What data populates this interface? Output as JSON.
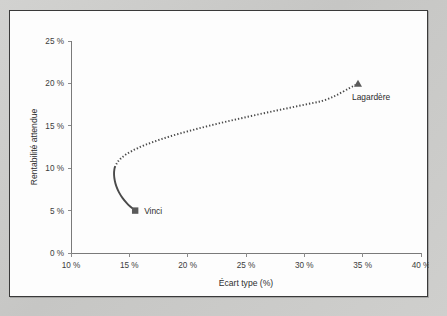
{
  "figure": {
    "background_color": "#c9c9c7",
    "panel_color": "#fdfdfd",
    "border_color": "#3a3a3a"
  },
  "chart_data": {
    "type": "line",
    "title": "",
    "subtitle": "",
    "xlabel": "Écart type (%)",
    "ylabel": "Rentabilité attendue",
    "xlim": [
      10,
      40
    ],
    "ylim": [
      0,
      25
    ],
    "xticks": [
      10,
      15,
      20,
      25,
      30,
      35,
      40
    ],
    "yticks": [
      0,
      5,
      10,
      15,
      20,
      25
    ],
    "xtick_labels": [
      "10 %",
      "15 %",
      "20 %",
      "25 %",
      "30 %",
      "35 %",
      "40 %"
    ],
    "ytick_labels": [
      "0 %",
      "5 %",
      "10 %",
      "15 %",
      "20 %",
      "25 %"
    ],
    "grid": false,
    "legend": "none",
    "line_style": "dotted",
    "line_color": "#4a4a4a",
    "series": [
      {
        "name": "Frontière efficiente Vinci - Lagardère",
        "x": [
          15.5,
          15.0,
          14.6,
          14.25,
          13.98,
          13.8,
          13.7,
          13.68,
          13.75,
          13.92,
          14.18,
          14.52,
          14.95,
          15.45,
          16.02,
          16.65,
          17.33,
          18.06,
          18.84,
          19.66,
          20.52,
          21.41,
          22.33,
          23.28,
          24.26,
          25.26,
          26.28,
          27.32,
          28.38,
          29.46,
          30.55,
          31.66,
          32.78,
          33.92,
          34.6
        ],
        "y": [
          5.0,
          5.55,
          6.15,
          6.8,
          7.5,
          8.2,
          8.9,
          9.55,
          10.1,
          10.6,
          11.05,
          11.45,
          11.83,
          12.2,
          12.56,
          12.9,
          13.24,
          13.57,
          13.9,
          14.22,
          14.54,
          14.86,
          15.17,
          15.48,
          15.79,
          16.1,
          16.41,
          16.72,
          17.02,
          17.33,
          17.64,
          17.95,
          18.6,
          19.5,
          19.95
        ]
      }
    ],
    "annotations": [
      {
        "label": "Vinci",
        "x": 15.5,
        "y": 5.0,
        "marker": "square",
        "marker_color": "#5a5a5a",
        "label_position": "right"
      },
      {
        "label": "Lagardère",
        "x": 34.6,
        "y": 19.95,
        "marker": "triangle",
        "marker_color": "#5a5a5a",
        "label_position": "below-right"
      }
    ]
  }
}
